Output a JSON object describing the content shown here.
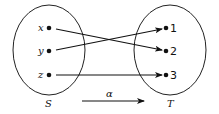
{
  "diagram": {
    "type": "function-mapping",
    "domain_set": {
      "label": "S",
      "elements": [
        "x",
        "y",
        "z"
      ]
    },
    "codomain_set": {
      "label": "T",
      "elements": [
        "1",
        "2",
        "3"
      ]
    },
    "mapping_label": "α",
    "mappings": [
      {
        "from": "x",
        "to": "2"
      },
      {
        "from": "y",
        "to": "1"
      },
      {
        "from": "z",
        "to": "3"
      }
    ]
  }
}
